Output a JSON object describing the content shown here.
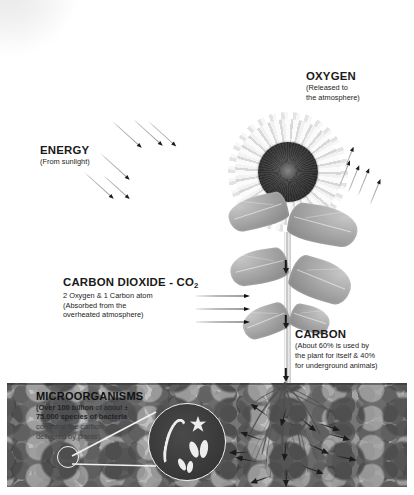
{
  "diagram": {
    "title_hidden_watermark": "",
    "labels": {
      "oxygen": {
        "heading": "OXYGEN",
        "lines": [
          "(Released to",
          "the atmosphere)"
        ]
      },
      "energy": {
        "heading": "ENERGY",
        "lines": [
          "(From sunlight)"
        ]
      },
      "carbon_dioxide": {
        "heading": "CARBON DIOXIDE - CO",
        "heading_sub": "2",
        "lines": [
          "2 Oxygen & 1 Carbon atom",
          "(Absorbed from the",
          "overheated atmosphere)"
        ]
      },
      "carbon": {
        "heading": "CARBON",
        "lines": [
          "(About 60% is used by",
          "the plant for itself & 40%",
          "for underground animals)"
        ]
      },
      "microorganisms": {
        "heading": "MICROORGANISMS",
        "line1_bold": "(Over 100 billion",
        "line1_rest": " of about ±",
        "line2_bold": "75.000 species of bacteria",
        "line3": "consume the carbon",
        "line4": "delivered by plants)"
      }
    },
    "icons": {
      "sun_glow": "sun-glow",
      "sunflower": "sunflower-plant",
      "soil": "soil-band",
      "roots": "root-system",
      "magnifier": "magnifier-inset",
      "bacteria": "bacteria-shapes"
    },
    "colors": {
      "soil_base": "#9d9d9d",
      "arrow_dark": "#1b1b1b",
      "arrow_tail": "#b9b9b9",
      "text": "#1a1a1a",
      "inset_fill": "#3a3a3a",
      "inset_stroke": "#f0f0f0"
    },
    "arrows": {
      "energy_count": 6,
      "oxygen_count": 5,
      "co2_count": 3,
      "stem_down_count": 3,
      "root_count": 14
    }
  }
}
